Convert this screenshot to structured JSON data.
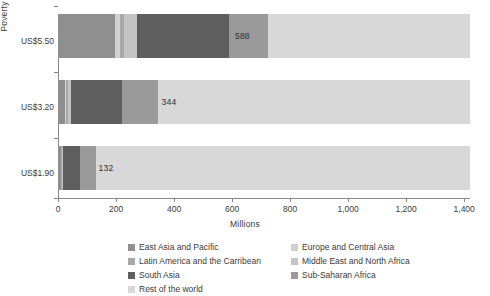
{
  "chart_data": {
    "type": "bar",
    "orientation": "horizontal",
    "stacked": true,
    "title": "",
    "xlabel": "Millions",
    "ylabel": "Poverty lines",
    "categories": [
      "US$5.50",
      "US$3.20",
      "US$1.90"
    ],
    "xlim": [
      0,
      1420
    ],
    "xticks": [
      0,
      200,
      400,
      600,
      800,
      1000,
      1200,
      1400
    ],
    "xticklabels": [
      "0",
      "200",
      "400",
      "600",
      "800",
      "1,000",
      "1,200",
      "1,400"
    ],
    "grid": false,
    "legend_position": "bottom",
    "series": [
      {
        "name": "East Asia and Pacific",
        "color": "#8f8f8f",
        "values": [
          196,
          24,
          10
        ]
      },
      {
        "name": "Europe and Central Asia",
        "color": "#d0d0d0",
        "values": [
          16,
          5,
          2
        ]
      },
      {
        "name": "Latin America and the Carribean",
        "color": "#a8a8a8",
        "values": [
          16,
          6,
          3
        ]
      },
      {
        "name": "Middle East and North Africa",
        "color": "#c4c4c4",
        "values": [
          44,
          10,
          4
        ]
      },
      {
        "name": "South Asia",
        "color": "#5e5e5e",
        "values": [
          316,
          176,
          57
        ]
      },
      {
        "name": "Sub-Saharan Africa",
        "color": "#9a9a9a",
        "values": [
          137,
          123,
          56
        ]
      },
      {
        "name": "Rest of the world",
        "color": "#d8d8d8",
        "values": [
          695,
          1076,
          1288
        ]
      }
    ],
    "bar_value_labels": [
      "588",
      "344",
      "132"
    ],
    "bar_value_label_positions": [
      610,
      357,
      140
    ]
  },
  "legend": {
    "columns": [
      [
        {
          "label": "East Asia and Pacific",
          "color": "#8f8f8f"
        },
        {
          "label": "Latin America and the Carribean",
          "color": "#a8a8a8"
        },
        {
          "label": "South Asia",
          "color": "#5e5e5e"
        },
        {
          "label": "Rest of the world",
          "color": "#d8d8d8"
        }
      ],
      [
        {
          "label": "Europe and Central Asia",
          "color": "#d0d0d0"
        },
        {
          "label": "Middle East and North Africa",
          "color": "#c4c4c4"
        },
        {
          "label": "Sub-Saharan Africa",
          "color": "#9a9a9a"
        }
      ]
    ]
  },
  "axes": {
    "y_title": "Poverty lines",
    "x_title": "Millions"
  }
}
